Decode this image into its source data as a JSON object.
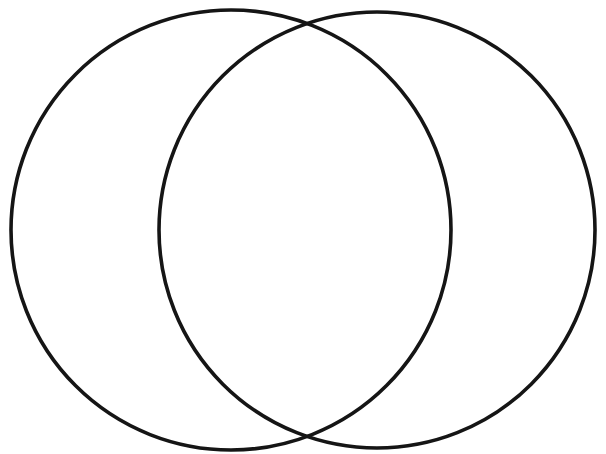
{
  "figure": {
    "title": "Two overlapping circles (blank Venn diagram outline)",
    "type": "venn-outline",
    "width": 606,
    "height": 454,
    "background_color": "#ffffff",
    "stroke_color": "#151515",
    "stroke_width": 3.6,
    "fill": "none",
    "labels": [],
    "annotations": [],
    "shapes": [
      {
        "name": "left-circle",
        "cx": 231,
        "cy": 230,
        "r": 220,
        "leftmost_x": 11,
        "rightmost_x": 451,
        "topmost_y": 10,
        "bottommost_y": 450
      },
      {
        "name": "right-circle",
        "cx": 377,
        "cy": 230,
        "r": 218,
        "leftmost_x": 159,
        "rightmost_x": 595,
        "topmost_y": 12,
        "bottommost_y": 448
      }
    ],
    "intersections": [
      {
        "name": "upper-intersection",
        "x": 305,
        "y": 28
      },
      {
        "name": "lower-intersection",
        "x": 305,
        "y": 433
      }
    ],
    "regions": [
      {
        "name": "left-only-region",
        "label": ""
      },
      {
        "name": "overlap-region",
        "label": ""
      },
      {
        "name": "right-only-region",
        "label": ""
      }
    ]
  }
}
